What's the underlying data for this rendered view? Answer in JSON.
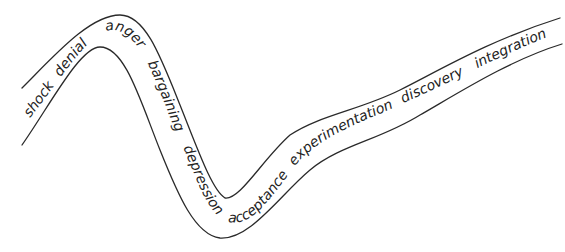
{
  "diagram": {
    "type": "change-curve",
    "stroke_color": "#2a2a2a",
    "stages": [
      {
        "label": "shock"
      },
      {
        "label": "denial"
      },
      {
        "label": "anger"
      },
      {
        "label": "bargaining"
      },
      {
        "label": "depression"
      },
      {
        "label": "acceptance"
      },
      {
        "label": "experimentation"
      },
      {
        "label": "discovery"
      },
      {
        "label": "integration"
      }
    ]
  }
}
